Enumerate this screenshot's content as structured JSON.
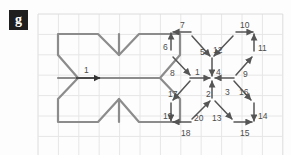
{
  "panel": {
    "label": "g"
  },
  "canvas": {
    "width": 291,
    "height": 155,
    "background": "#fdfdfd"
  },
  "grid": {
    "origin_x": 38,
    "origin_y": 14,
    "cell": 20.4,
    "cols": 12,
    "rows": 7,
    "color": "#e6e6e6",
    "border_color": "#dcdcdc"
  },
  "left_figure": {
    "name": "pinwheel-outline",
    "stroke": "#8c8c8c",
    "stroke_width": 2.2,
    "center_x": 98,
    "center_y": 78,
    "points": [
      [
        58,
        34
      ],
      [
        98,
        34
      ],
      [
        119,
        55
      ],
      [
        139,
        34
      ],
      [
        180,
        34
      ],
      [
        180,
        55
      ],
      [
        160,
        78
      ],
      [
        180,
        99
      ],
      [
        180,
        122
      ],
      [
        139,
        122
      ],
      [
        119,
        99
      ],
      [
        98,
        122
      ],
      [
        58,
        122
      ],
      [
        58,
        99
      ],
      [
        78,
        78
      ],
      [
        58,
        55
      ]
    ],
    "spokes": [
      [
        98,
        78,
        58,
        78
      ],
      [
        98,
        78,
        160,
        78
      ],
      [
        119,
        55,
        119,
        34
      ],
      [
        119,
        99,
        119,
        122
      ]
    ],
    "arrow": {
      "label": "1",
      "x1": 76,
      "y1": 78,
      "x2": 100,
      "y2": 78,
      "label_x": 84,
      "label_y": 66,
      "color": "#333333"
    }
  },
  "right_figure": {
    "name": "vector-decomposition",
    "center_x": 212,
    "center_y": 78,
    "arrow_color": "#555555",
    "arrow_width": 1.5,
    "label_color": "#4c4c4c",
    "vectors": [
      {
        "id": "1",
        "x1": 190,
        "y1": 78,
        "x2": 210,
        "y2": 78,
        "lx": 195,
        "ly": 68,
        "dir": "right"
      },
      {
        "id": "2",
        "x1": 212,
        "y1": 98,
        "x2": 212,
        "y2": 81,
        "lx": 206,
        "ly": 90,
        "dir": "up"
      },
      {
        "id": "3",
        "x1": 234,
        "y1": 78,
        "x2": 215,
        "y2": 78,
        "lx": 225,
        "ly": 88,
        "dir": "left"
      },
      {
        "id": "4",
        "x1": 212,
        "y1": 58,
        "x2": 212,
        "y2": 76,
        "lx": 216,
        "ly": 68,
        "dir": "down"
      },
      {
        "id": "5",
        "x1": 192,
        "y1": 36,
        "x2": 210,
        "y2": 56,
        "lx": 200,
        "ly": 48,
        "dir": "down-right"
      },
      {
        "id": "6",
        "x1": 171,
        "y1": 50,
        "x2": 171,
        "y2": 33,
        "lx": 163,
        "ly": 43,
        "dir": "up"
      },
      {
        "id": "7",
        "x1": 191,
        "y1": 32,
        "x2": 173,
        "y2": 32,
        "lx": 180,
        "ly": 21,
        "dir": "left"
      },
      {
        "id": "8",
        "x1": 173,
        "y1": 57,
        "x2": 190,
        "y2": 75,
        "lx": 170,
        "ly": 69,
        "dir": "down-right"
      },
      {
        "id": "9",
        "x1": 236,
        "y1": 75,
        "x2": 252,
        "y2": 57,
        "lx": 243,
        "ly": 70,
        "dir": "up-right"
      },
      {
        "id": "10",
        "x1": 236,
        "y1": 32,
        "x2": 253,
        "y2": 32,
        "lx": 240,
        "ly": 21,
        "dir": "right"
      },
      {
        "id": "11",
        "x1": 254,
        "y1": 51,
        "x2": 254,
        "y2": 34,
        "lx": 258,
        "ly": 44,
        "dir": "up"
      },
      {
        "id": "12",
        "x1": 233,
        "y1": 36,
        "x2": 214,
        "y2": 56,
        "lx": 213,
        "ly": 46,
        "dir": "down-left"
      },
      {
        "id": "13",
        "x1": 215,
        "y1": 101,
        "x2": 232,
        "y2": 119,
        "lx": 212,
        "ly": 114,
        "dir": "down-right"
      },
      {
        "id": "14",
        "x1": 254,
        "y1": 103,
        "x2": 254,
        "y2": 121,
        "lx": 258,
        "ly": 112,
        "dir": "down"
      },
      {
        "id": "15",
        "x1": 234,
        "y1": 122,
        "x2": 252,
        "y2": 122,
        "lx": 240,
        "ly": 129,
        "dir": "right"
      },
      {
        "id": "16",
        "x1": 234,
        "y1": 81,
        "x2": 251,
        "y2": 100,
        "lx": 239,
        "ly": 88,
        "dir": "down-right"
      },
      {
        "id": "17",
        "x1": 190,
        "y1": 81,
        "x2": 173,
        "y2": 100,
        "lx": 168,
        "ly": 90,
        "dir": "down-left"
      },
      {
        "id": "18",
        "x1": 191,
        "y1": 122,
        "x2": 173,
        "y2": 122,
        "lx": 181,
        "ly": 129,
        "dir": "left"
      },
      {
        "id": "19",
        "x1": 171,
        "y1": 103,
        "x2": 171,
        "y2": 121,
        "lx": 163,
        "ly": 112,
        "dir": "down"
      },
      {
        "id": "20",
        "x1": 192,
        "y1": 119,
        "x2": 210,
        "y2": 101,
        "lx": 194,
        "ly": 114,
        "dir": "up-right"
      }
    ]
  }
}
